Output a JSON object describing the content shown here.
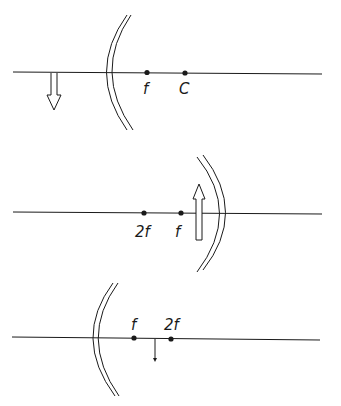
{
  "diagrams": [
    {
      "id": "concave-mirror-object-behind",
      "labels": {
        "p1": "f",
        "p2": "C"
      }
    },
    {
      "id": "convex-facing-mirror-object-near",
      "labels": {
        "p1": "2f",
        "p2": "f"
      }
    },
    {
      "id": "concave-mirror-small-object",
      "labels": {
        "p1": "f",
        "p2": "2f"
      }
    }
  ],
  "colors": {
    "line": "#1a1a1a",
    "background": "#ffffff"
  }
}
